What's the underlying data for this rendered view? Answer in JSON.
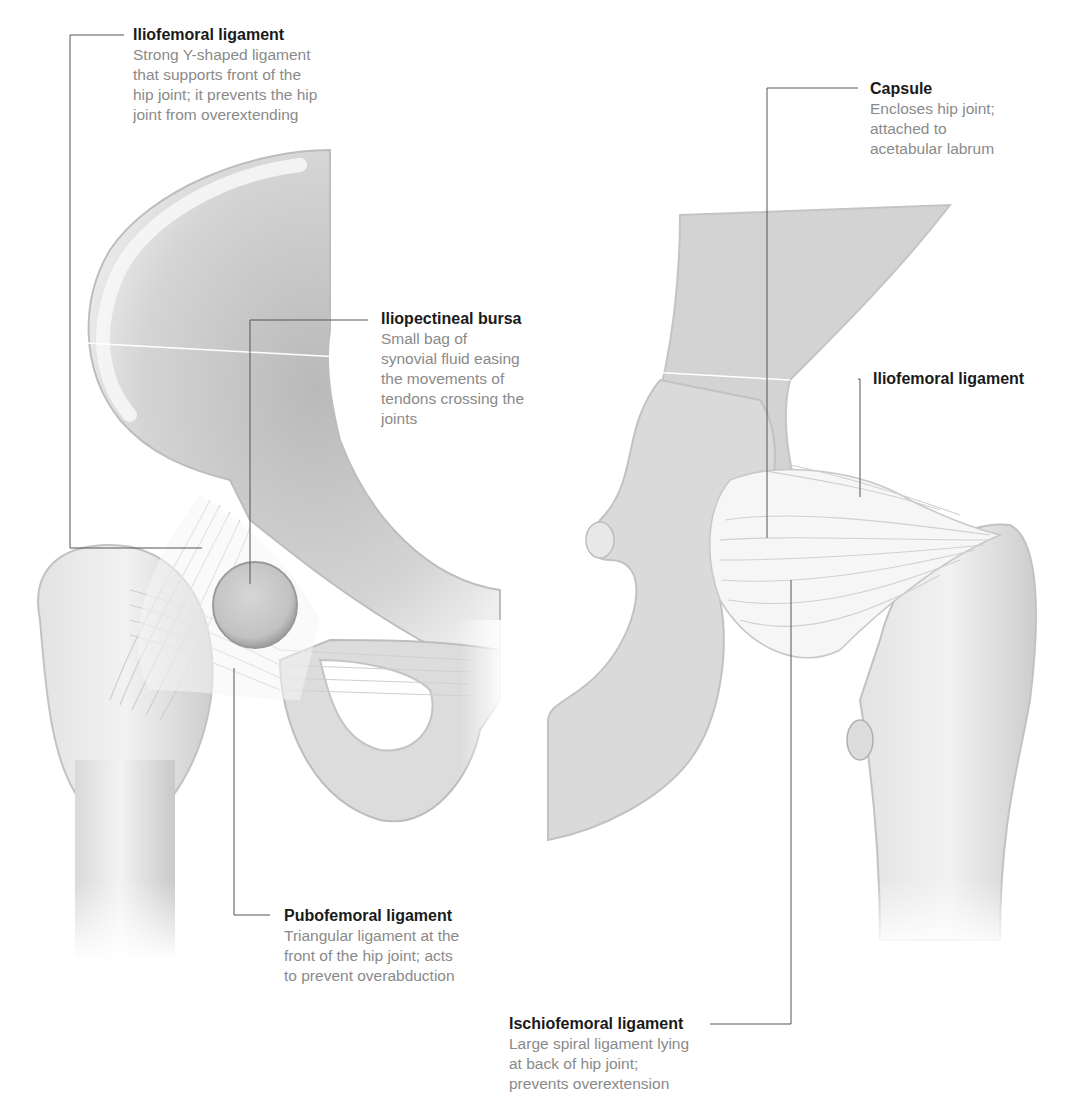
{
  "figure": {
    "views": [
      "front view of right hip",
      "back view of hip"
    ]
  },
  "callouts": [
    {
      "id": "iliofemoral-front",
      "title": "Iliofemoral ligament",
      "description": "Strong Y-shaped ligament\nthat supports front of the\nhip joint; it prevents the hip\njoint from overextending"
    },
    {
      "id": "iliopectineal",
      "title": "Iliopectineal bursa",
      "description": "Small bag of\nsynovial fluid easing\nthe movements of\ntendons crossing the\njoints"
    },
    {
      "id": "pubofemoral",
      "title": "Pubofemoral ligament",
      "description": "Triangular ligament at the\nfront of the hip joint; acts\nto prevent overabduction"
    },
    {
      "id": "capsule",
      "title": "Capsule",
      "description": "Encloses hip joint;\nattached to\nacetabular labrum"
    },
    {
      "id": "iliofemoral-back",
      "title": "Iliofemoral ligament",
      "description": ""
    },
    {
      "id": "ischiofemoral",
      "title": "Ischiofemoral ligament",
      "description": "Large spiral ligament lying\nat back of hip joint;\nprevents overextension"
    }
  ],
  "colors": {
    "title_text": "#1a1a1a",
    "desc_text": "#8a8a8a",
    "leader_line": "#555555",
    "bone_light": "#ececec",
    "bone_mid": "#d2d2d2",
    "bone_dark": "#a9a9a9",
    "ligament": "#f4f4f4"
  }
}
